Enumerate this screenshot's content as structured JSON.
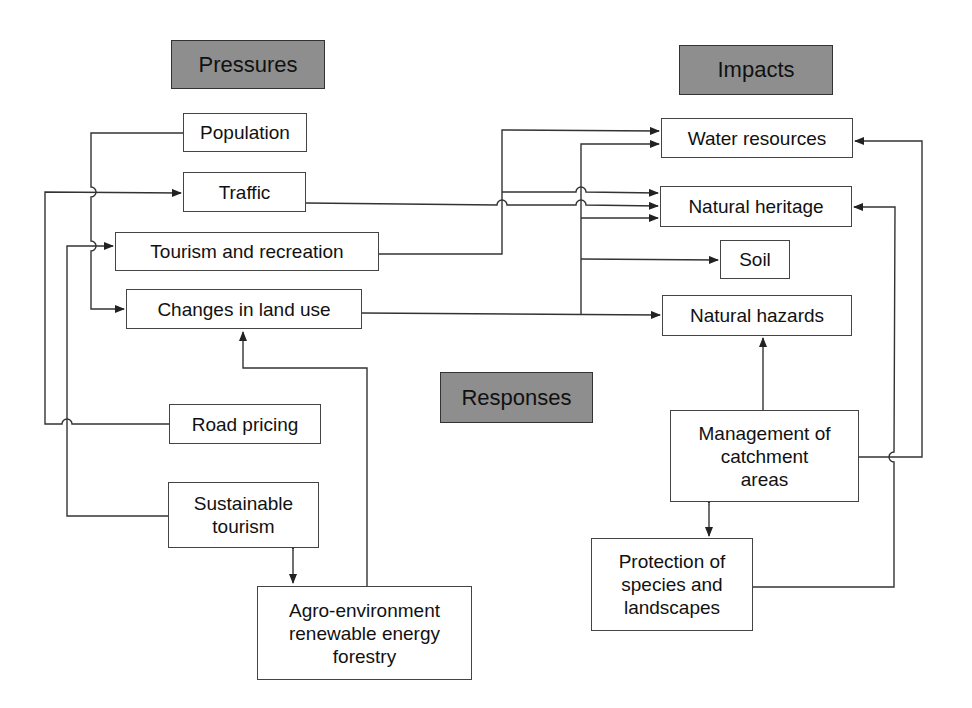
{
  "headers": {
    "pressures": "Pressures",
    "impacts": "Impacts",
    "responses": "Responses"
  },
  "pressures": {
    "population": "Population",
    "traffic": "Traffic",
    "tourism": "Tourism and recreation",
    "land_use": "Changes in land use"
  },
  "impacts": {
    "water": "Water resources",
    "heritage": "Natural heritage",
    "soil": "Soil",
    "hazards": "Natural hazards"
  },
  "responses": {
    "road_pricing": "Road pricing",
    "sustainable_tourism": "Sustainable\ntourism",
    "agro": "Agro-environment\nrenewable energy\nforestry",
    "catchment": "Management of\ncatchment\nareas",
    "protection": "Protection of\nspecies and\nlandscapes"
  },
  "colors": {
    "header_fill": "#8e8e8e",
    "line": "#333333"
  }
}
